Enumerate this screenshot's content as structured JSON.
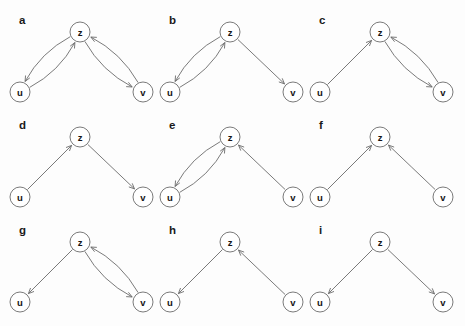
{
  "figure": {
    "title": "",
    "background_color": "#fdfdfd",
    "node_stroke_color": "#6b6b6b",
    "edge_stroke_color": "#6b6b6b",
    "node_fill_color": "#ffffff",
    "label_color": "#1a1a1a",
    "grid": {
      "columns": 3,
      "rows": 3
    },
    "node_radius": 10,
    "node_names": [
      "u",
      "z",
      "v"
    ]
  },
  "panels": [
    {
      "id": "a",
      "label": "a",
      "row": 0,
      "col": 0,
      "nodes": [
        {
          "name": "u",
          "label": "u"
        },
        {
          "name": "z",
          "label": "z"
        },
        {
          "name": "v",
          "label": "v"
        }
      ],
      "edges": [
        {
          "from": "z",
          "to": "u",
          "style": "curved",
          "bend": "outer"
        },
        {
          "from": "u",
          "to": "z",
          "style": "curved",
          "bend": "inner"
        },
        {
          "from": "z",
          "to": "v",
          "style": "curved",
          "bend": "inner"
        },
        {
          "from": "v",
          "to": "z",
          "style": "curved",
          "bend": "outer"
        }
      ]
    },
    {
      "id": "b",
      "label": "b",
      "row": 0,
      "col": 1,
      "nodes": [
        {
          "name": "u",
          "label": "u"
        },
        {
          "name": "z",
          "label": "z"
        },
        {
          "name": "v",
          "label": "v"
        }
      ],
      "edges": [
        {
          "from": "z",
          "to": "u",
          "style": "curved",
          "bend": "outer"
        },
        {
          "from": "u",
          "to": "z",
          "style": "curved",
          "bend": "inner"
        },
        {
          "from": "z",
          "to": "v",
          "style": "straight",
          "bend": "none"
        }
      ]
    },
    {
      "id": "c",
      "label": "c",
      "row": 0,
      "col": 2,
      "nodes": [
        {
          "name": "u",
          "label": "u"
        },
        {
          "name": "z",
          "label": "z"
        },
        {
          "name": "v",
          "label": "v"
        }
      ],
      "edges": [
        {
          "from": "u",
          "to": "z",
          "style": "straight",
          "bend": "none"
        },
        {
          "from": "z",
          "to": "v",
          "style": "curved",
          "bend": "inner"
        },
        {
          "from": "v",
          "to": "z",
          "style": "curved",
          "bend": "outer"
        }
      ]
    },
    {
      "id": "d",
      "label": "d",
      "row": 1,
      "col": 0,
      "nodes": [
        {
          "name": "u",
          "label": "u"
        },
        {
          "name": "z",
          "label": "z"
        },
        {
          "name": "v",
          "label": "v"
        }
      ],
      "edges": [
        {
          "from": "u",
          "to": "z",
          "style": "straight",
          "bend": "none"
        },
        {
          "from": "z",
          "to": "v",
          "style": "straight",
          "bend": "none"
        }
      ]
    },
    {
      "id": "e",
      "label": "e",
      "row": 1,
      "col": 1,
      "nodes": [
        {
          "name": "u",
          "label": "u"
        },
        {
          "name": "z",
          "label": "z"
        },
        {
          "name": "v",
          "label": "v"
        }
      ],
      "edges": [
        {
          "from": "z",
          "to": "u",
          "style": "curved",
          "bend": "outer"
        },
        {
          "from": "u",
          "to": "z",
          "style": "curved",
          "bend": "inner"
        },
        {
          "from": "v",
          "to": "z",
          "style": "straight",
          "bend": "none"
        }
      ]
    },
    {
      "id": "f",
      "label": "f",
      "row": 1,
      "col": 2,
      "nodes": [
        {
          "name": "u",
          "label": "u"
        },
        {
          "name": "z",
          "label": "z"
        },
        {
          "name": "v",
          "label": "v"
        }
      ],
      "edges": [
        {
          "from": "u",
          "to": "z",
          "style": "straight",
          "bend": "none"
        },
        {
          "from": "v",
          "to": "z",
          "style": "straight",
          "bend": "none"
        }
      ]
    },
    {
      "id": "g",
      "label": "g",
      "row": 2,
      "col": 0,
      "nodes": [
        {
          "name": "u",
          "label": "u"
        },
        {
          "name": "z",
          "label": "z"
        },
        {
          "name": "v",
          "label": "v"
        }
      ],
      "edges": [
        {
          "from": "z",
          "to": "u",
          "style": "straight",
          "bend": "none"
        },
        {
          "from": "z",
          "to": "v",
          "style": "curved",
          "bend": "inner"
        },
        {
          "from": "v",
          "to": "z",
          "style": "curved",
          "bend": "outer"
        }
      ]
    },
    {
      "id": "h",
      "label": "h",
      "row": 2,
      "col": 1,
      "nodes": [
        {
          "name": "u",
          "label": "u"
        },
        {
          "name": "z",
          "label": "z"
        },
        {
          "name": "v",
          "label": "v"
        }
      ],
      "edges": [
        {
          "from": "z",
          "to": "u",
          "style": "straight",
          "bend": "none"
        },
        {
          "from": "v",
          "to": "z",
          "style": "straight",
          "bend": "none"
        }
      ]
    },
    {
      "id": "i",
      "label": "i",
      "row": 2,
      "col": 2,
      "nodes": [
        {
          "name": "u",
          "label": "u"
        },
        {
          "name": "z",
          "label": "z"
        },
        {
          "name": "v",
          "label": "v"
        }
      ],
      "edges": [
        {
          "from": "z",
          "to": "u",
          "style": "straight",
          "bend": "none"
        },
        {
          "from": "z",
          "to": "v",
          "style": "straight",
          "bend": "none"
        }
      ]
    }
  ]
}
